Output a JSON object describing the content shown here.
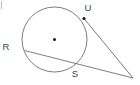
{
  "figure": {
    "type": "geometry-diagram",
    "canvas": {
      "width": 140,
      "height": 85,
      "background": "#ffffff"
    },
    "style": {
      "stroke_color": "#6e6e6e",
      "label_color": "#404040",
      "point_color": "#1a1a1a",
      "stroke_width": 0.9,
      "label_font_size": 9.5
    },
    "circle": {
      "name": "circle",
      "center": {
        "x": 54.5,
        "y": 39.5
      },
      "radius": 32.5,
      "center_dot_radius": 1.5
    },
    "external_point": {
      "name": "external-vertex",
      "x": 133,
      "y": 78
    },
    "points": [
      {
        "id": "U",
        "label": "U",
        "x": 84,
        "y": 18.5,
        "marker": true,
        "label_x": 88,
        "label_y": 11
      },
      {
        "id": "R",
        "label": "R",
        "x": 24.5,
        "y": 50.5,
        "marker": false,
        "label_x": 6,
        "label_y": 50
      },
      {
        "id": "S",
        "label": "S",
        "x": 78.5,
        "y": 64.5,
        "marker": false,
        "label_x": 75,
        "label_y": 77
      }
    ],
    "lines": [
      {
        "id": "tangent-U",
        "name": "tangent-line-through-u",
        "x1": 84,
        "y1": 18.5,
        "x2": 133,
        "y2": 78
      },
      {
        "id": "secant-RS",
        "name": "secant-line-through-r-and-s",
        "x1": 24.5,
        "y1": 50.5,
        "x2": 133,
        "y2": 78
      }
    ],
    "corner_tick": {
      "name": "corner-tick-mark",
      "x": 1.5,
      "y1": 1,
      "y2": 9
    }
  }
}
